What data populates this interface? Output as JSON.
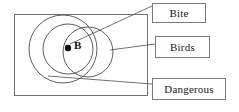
{
  "diagram": {
    "type": "venn-euler-diagram",
    "title": "",
    "universe": {
      "name": "universe-rectangle",
      "x": 14,
      "y": 14,
      "width": 134,
      "height": 82,
      "stroke": "#6f6f6f"
    },
    "circles": [
      {
        "name": "dangerous-circle",
        "label_ref": "Dangerous",
        "cx": 63,
        "cy": 49,
        "r": 34,
        "stroke": "#4d4d4d"
      },
      {
        "name": "birds-circle",
        "label_ref": "Birds",
        "cx": 68,
        "cy": 49,
        "r": 25,
        "stroke": "#4d4d4d"
      },
      {
        "name": "bite-circle",
        "label_ref": "Bite",
        "cx": 88,
        "cy": 52,
        "r": 25,
        "stroke": "#4d4d4d"
      }
    ],
    "points": [
      {
        "name": "point-b",
        "label": "B",
        "x": 68,
        "y": 48,
        "radius": 3.2,
        "fill": "#111111"
      }
    ],
    "connectors": [
      {
        "name": "connector-bite",
        "from_x": 70,
        "from_y": 44,
        "to_x": 152,
        "to_y": 6,
        "target": "Bite"
      },
      {
        "name": "connector-birds",
        "from_x": 110,
        "from_y": 50,
        "to_x": 155,
        "to_y": 44,
        "target": "Birds"
      },
      {
        "name": "connector-dangerous",
        "from_x": 48,
        "from_y": 76,
        "to_x": 152,
        "to_y": 84,
        "target": "Dangerous"
      }
    ],
    "labels": {
      "bite": "Bite",
      "birds": "Birds",
      "dangerous": "Dangerous",
      "point_b": "B"
    },
    "colors": {
      "frame_stroke": "#6f6f6f",
      "circle_stroke": "#4d4d4d",
      "box_stroke": "#7b7b7b",
      "text": "#17161a",
      "point_fill": "#111111",
      "background": "#ffffff"
    }
  }
}
